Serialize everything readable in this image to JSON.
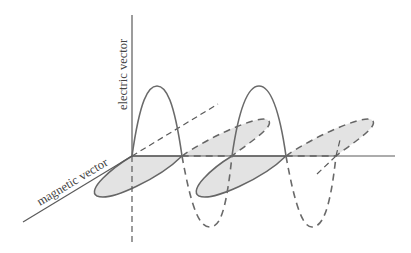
{
  "diagram": {
    "labels": {
      "electric": "electric vector",
      "magnetic": "magnetic vector"
    },
    "colors": {
      "line": "#5a5a5a",
      "fill": "#e3e3e3",
      "background": "#ffffff"
    },
    "wave": {
      "cycles_shown": 2,
      "electric_lobes": [
        "up-solid",
        "down-dashed",
        "up-solid",
        "down-dashed"
      ],
      "magnetic_lobes": [
        "front-solid",
        "back-dashed",
        "front-solid",
        "back-dashed"
      ]
    }
  }
}
